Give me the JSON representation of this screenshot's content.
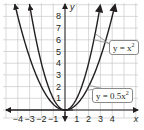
{
  "chart_data": {
    "type": "line",
    "title": "",
    "xlabel": "x",
    "ylabel": "y",
    "xlim": [
      -4.5,
      5
    ],
    "ylim": [
      -0.6,
      8.8
    ],
    "grid": true,
    "x_ticks": [
      "-4",
      "-3",
      "-2",
      "-1",
      "1",
      "2",
      "3",
      "4"
    ],
    "y_ticks": [
      "1",
      "2",
      "3",
      "4",
      "5",
      "6",
      "7",
      "8"
    ],
    "series": [
      {
        "name": "y = x²",
        "formula": "x^2",
        "x": [
          -3,
          -2,
          -1,
          0,
          1,
          2,
          3
        ],
        "values": [
          9,
          4,
          1,
          0,
          1,
          4,
          9
        ]
      },
      {
        "name": "y = 0.5x²",
        "formula": "0.5*x^2",
        "x": [
          -4,
          -3,
          -2,
          -1,
          0,
          1,
          2,
          3,
          4
        ],
        "values": [
          8,
          4.5,
          2,
          0.5,
          0,
          0.5,
          2,
          4.5,
          8
        ]
      }
    ],
    "annotations": [
      "y = x²",
      "y = 0.5x²"
    ],
    "line_color": "#231f20",
    "grid_color": "#c8c8c8"
  },
  "labels": {
    "parabola_narrow": "y = x",
    "parabola_narrow_exp": "2",
    "parabola_wide": "y = 0.5x",
    "parabola_wide_exp": "2"
  }
}
